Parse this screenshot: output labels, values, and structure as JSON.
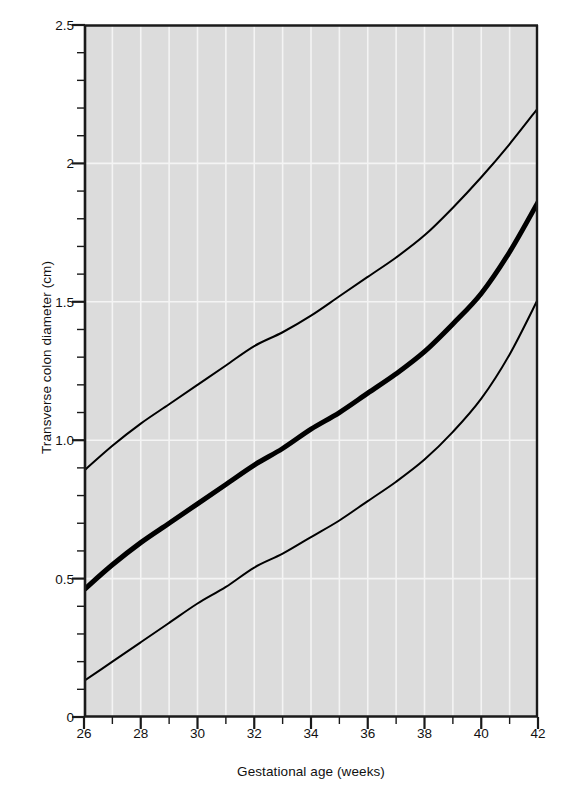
{
  "chart_data": {
    "type": "line",
    "title": "",
    "subtitle": "",
    "xlabel": "Gestational age (weeks)",
    "ylabel": "Transverse colon diameter (cm)",
    "xlim": [
      26,
      42
    ],
    "ylim": [
      0,
      2.5
    ],
    "xticks": [
      26,
      27,
      28,
      29,
      30,
      31,
      32,
      33,
      34,
      35,
      36,
      37,
      38,
      39,
      40,
      41,
      42
    ],
    "xtick_labels": [
      "26",
      "28",
      "30",
      "32",
      "34",
      "36",
      "38",
      "40",
      "42"
    ],
    "xtick_label_values": [
      26,
      28,
      30,
      32,
      34,
      36,
      38,
      40,
      42
    ],
    "ytick_labels": [
      "0",
      "0.5",
      "1.0",
      "1.5",
      "2",
      "2.5"
    ],
    "ytick_label_values": [
      0,
      0.5,
      1.0,
      1.5,
      2.0,
      2.5
    ],
    "yticks_minor_step": 0.1,
    "grid": "white gridlines on grey panel, vertical at every week, horizontal at major y ticks",
    "legend": "none",
    "plot_background": "#dcdcdc",
    "line_color": "#000000",
    "x": [
      26,
      27,
      28,
      29,
      30,
      31,
      32,
      33,
      34,
      35,
      36,
      37,
      38,
      39,
      40,
      41,
      42
    ],
    "series": [
      {
        "name": "Upper limit (95th centile)",
        "linewidth_px": 2,
        "values": [
          0.89,
          0.98,
          1.06,
          1.13,
          1.2,
          1.27,
          1.34,
          1.39,
          1.45,
          1.52,
          1.59,
          1.66,
          1.74,
          1.84,
          1.95,
          2.07,
          2.2
        ]
      },
      {
        "name": "Mean (50th centile)",
        "linewidth_px": 5,
        "values": [
          0.46,
          0.55,
          0.63,
          0.7,
          0.77,
          0.84,
          0.91,
          0.97,
          1.04,
          1.1,
          1.17,
          1.24,
          1.32,
          1.42,
          1.53,
          1.68,
          1.86
        ]
      },
      {
        "name": "Lower limit (5th centile)",
        "linewidth_px": 2,
        "values": [
          0.13,
          0.2,
          0.27,
          0.34,
          0.41,
          0.47,
          0.54,
          0.59,
          0.65,
          0.71,
          0.78,
          0.85,
          0.93,
          1.03,
          1.15,
          1.31,
          1.51
        ]
      }
    ]
  },
  "axes": {
    "xlabel": "Gestational age (weeks)",
    "ylabel": "Transverse colon diameter (cm)"
  }
}
